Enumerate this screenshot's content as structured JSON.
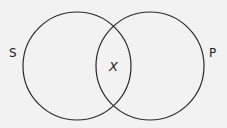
{
  "diagram": {
    "type": "venn",
    "circles": [
      {
        "label": "S",
        "cx": 77,
        "cy": 66,
        "r": 54
      },
      {
        "label": "P",
        "cx": 150,
        "cy": 66,
        "r": 54
      }
    ],
    "intersection_label": "X",
    "stroke_color": "#2a2a2a",
    "background": "#f2f2f2"
  }
}
